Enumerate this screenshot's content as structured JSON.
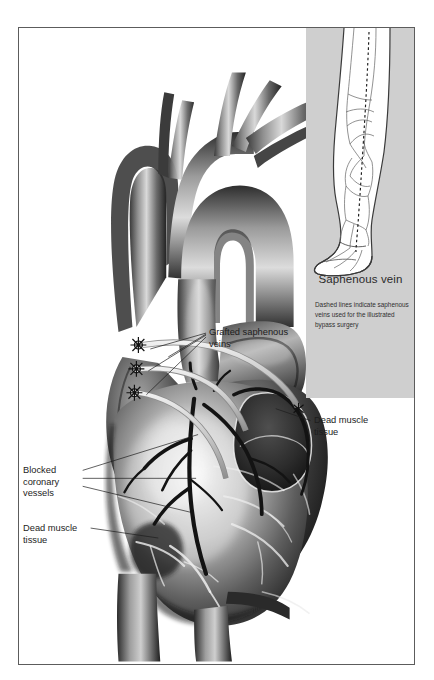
{
  "figure": {
    "kind": "medical-illustration",
    "border_color": "#5c5c5c",
    "background": "#ffffff"
  },
  "labels": {
    "grafted_veins": "Grafted saphenous\nveins",
    "dead_muscle_right": "Dead muscle\ntissue",
    "blocked_vessels": "Blocked\ncoronary\nvessels",
    "dead_muscle_left": "Dead muscle\ntissue"
  },
  "inset": {
    "title": "Saphenous vein",
    "caption": "Dashed lines indicate saphenous veins used for the illustrated bypass surgery",
    "panel_color": "#cfcfcf",
    "subject": "human leg and foot with superficial venous network"
  },
  "palette": {
    "ink": "#1d1d1d",
    "panel_gray": "#cfcfcf",
    "frame": "#5c5c5c",
    "muscle_dark": "#2a2a2a",
    "muscle_mid": "#6e6e6e",
    "vessel_pale": "#d8d8d8",
    "highlight": "#f2f2f2"
  }
}
